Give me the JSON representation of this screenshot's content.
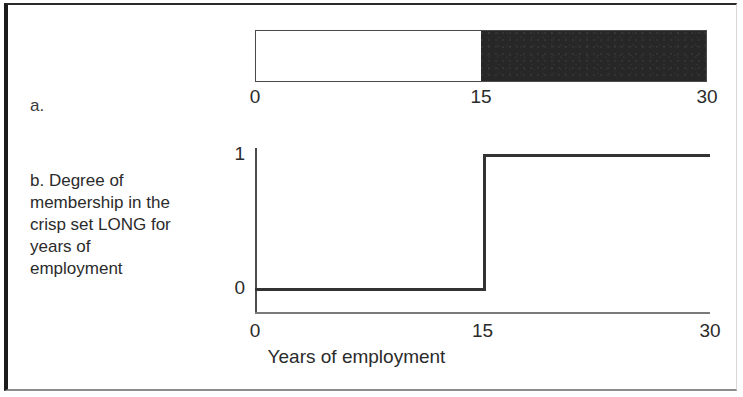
{
  "figure": {
    "panel_a": {
      "letter": "a.",
      "bar": {
        "axis_min": 0,
        "axis_max": 30,
        "threshold": 15,
        "light_label": "not LONG",
        "dark_label": "LONG",
        "light_color": "#ffffff",
        "dark_color": "#272727",
        "border_color": "#4a4a4a"
      },
      "ticks": [
        {
          "value": 0,
          "label": "0"
        },
        {
          "value": 15,
          "label": "15"
        },
        {
          "value": 30,
          "label": "30"
        }
      ]
    },
    "panel_b": {
      "letter": "b.",
      "caption": "b. Degree of\n    membership in  the\n    crisp set LONG for\n    years of\n    employment"
    }
  },
  "chart_data": {
    "type": "line",
    "title": "",
    "subtitle": "",
    "xlabel": "Years of employment",
    "ylabel": "",
    "xlim": [
      0,
      30
    ],
    "ylim": [
      0,
      1
    ],
    "grid": false,
    "legend": false,
    "xticks": [
      0,
      15,
      30
    ],
    "xtick_labels": [
      "0",
      "15",
      "30"
    ],
    "yticks": [
      0,
      1
    ],
    "ytick_labels": [
      "0",
      "1"
    ],
    "series": [
      {
        "name": "Degree of membership in the crisp set LONG",
        "step": "post",
        "x": [
          0,
          15,
          15,
          30
        ],
        "y": [
          0,
          0,
          1,
          1
        ],
        "color": "#333333"
      }
    ],
    "annotations": []
  }
}
